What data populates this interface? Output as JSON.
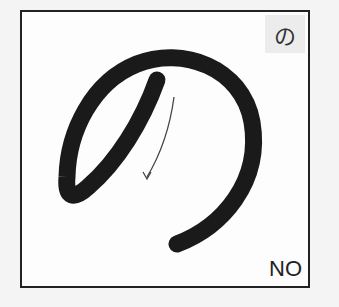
{
  "card": {
    "kana": "の",
    "romaji": "NO",
    "stroke_color": "#1a1a1a",
    "arrow_color": "#444444",
    "stroke_count": 1
  }
}
